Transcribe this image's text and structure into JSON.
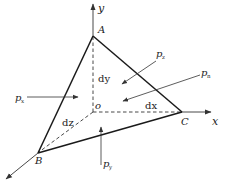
{
  "diagram": {
    "colors": {
      "line": "#1a1a1a",
      "axis": "#333333",
      "arrow": "#333333",
      "text": "#222222",
      "background": "#ffffff"
    },
    "axes": {
      "x": "x",
      "y": "y",
      "z": "z",
      "origin": "o"
    },
    "vertices": {
      "A": "A",
      "B": "B",
      "C": "C"
    },
    "edges": {
      "dx": "dx",
      "dy": "dy",
      "dz": "dz"
    },
    "forces": {
      "px": {
        "base": "p",
        "sub": "x"
      },
      "py": {
        "base": "p",
        "sub": "y"
      },
      "pz": {
        "base": "p",
        "sub": "z"
      },
      "pn": {
        "base": "p",
        "sub": "n"
      }
    }
  }
}
